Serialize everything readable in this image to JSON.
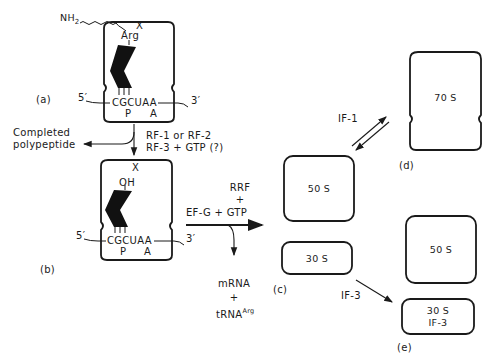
{
  "panels": {
    "a": {
      "label": "(a)",
      "top_site": "X",
      "amino_group": "NH",
      "amino_group_sub": "2",
      "amino_acid": "Arg",
      "codon_5": "5′",
      "codon_3": "3′",
      "codons": "CGCUAA",
      "site_p": "P",
      "site_a": "A"
    },
    "b": {
      "label": "(b)",
      "top_site": "X",
      "hydroxyl": "OH",
      "codon_5": "5′",
      "codon_3": "3′",
      "codons": "CGCUAA",
      "site_p": "P",
      "site_a": "A"
    },
    "c": {
      "label": "(c)",
      "large_subunit": "50 S",
      "small_subunit": "30 S"
    },
    "d": {
      "label": "(d)",
      "ribosome": "70 S"
    },
    "e": {
      "label": "(e)",
      "large_subunit": "50 S",
      "small_subunit": "30 S",
      "small_subunit_factor": "IF-3"
    }
  },
  "steps": {
    "release": {
      "line1": "RF-1 or RF-2",
      "line2": "RF-3 + GTP (?)",
      "product_line1": "Completed",
      "product_line2": "polypeptide"
    },
    "recycling": {
      "line1": "RRF",
      "line2": "+",
      "line3": "EF-G + GTP",
      "product_line1": "mRNA",
      "product_line2": "+",
      "product_line3": "tRNA",
      "product_sup": "Arg"
    },
    "association": {
      "label": "IF-1"
    },
    "dissociation": {
      "label": "IF-3"
    }
  }
}
